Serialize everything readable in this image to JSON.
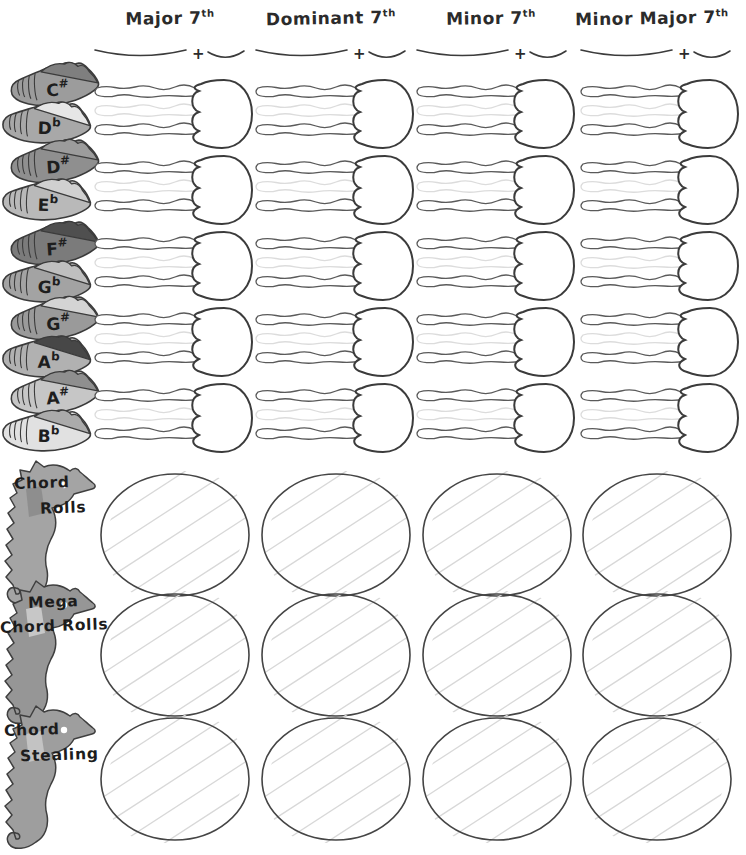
{
  "columns": [
    {
      "name": "Major 7",
      "sup": "th"
    },
    {
      "name": "Dominant 7",
      "sup": "th"
    },
    {
      "name": "Minor 7",
      "sup": "th"
    },
    {
      "name": "Minor Major 7",
      "sup": "th"
    }
  ],
  "plus": "+",
  "shell_pairs": [
    {
      "sharp": {
        "label": "C",
        "accidental": "#",
        "body": "#9c9c9c",
        "lip": "#7f7f7f"
      },
      "flat": {
        "label": "D",
        "accidental": "b",
        "body": "#a8a8a8",
        "lip": "#e6e6e6"
      }
    },
    {
      "sharp": {
        "label": "D",
        "accidental": "#",
        "body": "#8f8f8f",
        "lip": "#9c9c9c"
      },
      "flat": {
        "label": "E",
        "accidental": "b",
        "body": "#b9b9b9",
        "lip": "#d0d0d0"
      }
    },
    {
      "sharp": {
        "label": "F",
        "accidental": "#",
        "body": "#7b7b7b",
        "lip": "#4f4f4f"
      },
      "flat": {
        "label": "G",
        "accidental": "b",
        "body": "#a3a3a3",
        "lip": "#bfbfbf"
      }
    },
    {
      "sharp": {
        "label": "G",
        "accidental": "#",
        "body": "#9a9a9a",
        "lip": "#d4d4d4"
      },
      "flat": {
        "label": "A",
        "accidental": "b",
        "body": "#b1b1b1",
        "lip": "#474747"
      }
    },
    {
      "sharp": {
        "label": "A",
        "accidental": "#",
        "body": "#c6c6c6",
        "lip": "#8f8f8f"
      },
      "flat": {
        "label": "B",
        "accidental": "b",
        "body": "#e1e1e1",
        "lip": "#ababab"
      }
    }
  ],
  "grid": {
    "rows": 5,
    "cols": 4
  },
  "bottom_rows": [
    {
      "line1": "Chord",
      "line2": "Rolls",
      "body": "#a4a4a4",
      "patch": "#8c8c8c"
    },
    {
      "line1": "Mega",
      "line2": "Chord Rolls",
      "body": "#969696",
      "patch": "#cccccc"
    },
    {
      "line1": "Chord",
      "line2": "Stealing",
      "body": "#9e9e9e",
      "patch": "#c6c6c6"
    }
  ],
  "ovals_per_row": 4,
  "colors": {
    "outline": "#3b3b3b",
    "faint": "#dcdcdc",
    "hatch": "#d8d8d8",
    "text": "#2b2b2b"
  }
}
